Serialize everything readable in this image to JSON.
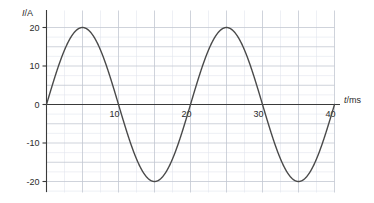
{
  "chart_data": {
    "type": "line",
    "title": "",
    "subtitle": "",
    "xlabel": "t/ms",
    "xlabel_symbol": "t",
    "xlabel_unit": "ms",
    "ylabel": "I/A",
    "ylabel_symbol": "I",
    "ylabel_unit": "A",
    "xlim": [
      0,
      40
    ],
    "ylim": [
      -22,
      22
    ],
    "xticks": [
      10,
      20,
      30,
      40
    ],
    "xtick_labels": [
      "10",
      "20",
      "30",
      "40"
    ],
    "yticks": [
      20,
      10,
      0,
      -10,
      -20
    ],
    "ytick_labels": [
      "20",
      "10",
      "0",
      "-10",
      "-20"
    ],
    "grid": true,
    "grid_major_step_x": 5,
    "grid_minor_step_x": 2.5,
    "grid_major_step_y": 5,
    "grid_minor_step_y": 2.5,
    "legend": null,
    "legend_position": "none",
    "annotations": [],
    "series": [
      {
        "name": "current",
        "waveform": "sine",
        "amplitude": 20,
        "period": 20,
        "phase": 0,
        "offset": 0,
        "color": "#4a4a4a",
        "line_width": 1.4,
        "x": [
          0,
          1,
          2,
          3,
          4,
          5,
          6,
          7,
          8,
          9,
          10,
          11,
          12,
          13,
          14,
          15,
          16,
          17,
          18,
          19,
          20,
          21,
          22,
          23,
          24,
          25,
          26,
          27,
          28,
          29,
          30,
          31,
          32,
          33,
          34,
          35,
          36,
          37,
          38,
          39,
          40
        ],
        "values": [
          0,
          6.18,
          11.76,
          16.18,
          19.02,
          20,
          19.02,
          16.18,
          11.76,
          6.18,
          0,
          -6.18,
          -11.76,
          -16.18,
          -19.02,
          -20,
          -19.02,
          -16.18,
          -11.76,
          -6.18,
          0,
          6.18,
          11.76,
          16.18,
          19.02,
          20,
          19.02,
          16.18,
          11.76,
          6.18,
          0,
          -6.18,
          -11.76,
          -16.18,
          -19.02,
          -20,
          -19.02,
          -16.18,
          -11.76,
          -6.18,
          0
        ]
      }
    ]
  },
  "colors": {
    "curve": "#4a4a4a",
    "axis": "#3a3a3a",
    "grid_major": "#c3c8d2",
    "grid_minor": "#e2e6ee",
    "text": "#2b2b2b",
    "background": "#ffffff"
  }
}
